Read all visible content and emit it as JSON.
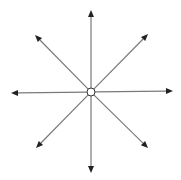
{
  "diagram": {
    "title": "Eight arrows radiating from a central point",
    "center": {
      "x": 91,
      "y": 92,
      "radius": 4,
      "fill": "#ffffff",
      "stroke": "#333333"
    },
    "line_color": "#7a7a7a",
    "arrowhead_color": "#222222",
    "arrows": [
      {
        "direction": "up",
        "x": 91,
        "y": 10
      },
      {
        "direction": "up-right",
        "x": 148,
        "y": 34
      },
      {
        "direction": "right",
        "x": 173,
        "y": 91
      },
      {
        "direction": "down-right",
        "x": 148,
        "y": 148
      },
      {
        "direction": "down",
        "x": 91,
        "y": 173
      },
      {
        "direction": "down-left",
        "x": 36,
        "y": 148
      },
      {
        "direction": "left",
        "x": 11,
        "y": 93
      },
      {
        "direction": "up-left",
        "x": 35,
        "y": 35
      }
    ]
  }
}
